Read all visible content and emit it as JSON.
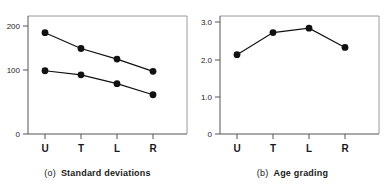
{
  "figure": {
    "panels": [
      {
        "caption_tag": "(o)",
        "caption_text": "Standard deviations",
        "x_ticks": [
          "U",
          "T",
          "L",
          "R"
        ],
        "y_ticks": [
          "0",
          "100",
          "200"
        ]
      },
      {
        "caption_tag": "(b)",
        "caption_text": "Age grading",
        "x_ticks": [
          "U",
          "T",
          "L",
          "R"
        ],
        "y_ticks": [
          "0",
          "1.0",
          "2.0",
          "3.0"
        ]
      }
    ]
  },
  "chart_data": [
    {
      "type": "line",
      "title": "Standard deviations",
      "panel_label": "(o)",
      "xlabel": "",
      "ylabel": "",
      "categories": [
        "U",
        "T",
        "L",
        "R"
      ],
      "ylim": [
        0,
        220
      ],
      "yticks": [
        0,
        100,
        200
      ],
      "grid": false,
      "legend": "none",
      "markers": "filled-circle",
      "series": [
        {
          "name": "upper",
          "values": [
            173,
            146,
            128,
            107
          ]
        },
        {
          "name": "lower",
          "values": [
            108,
            101,
            86,
            67
          ]
        }
      ]
    },
    {
      "type": "line",
      "title": "Age grading",
      "panel_label": "(b)",
      "xlabel": "",
      "ylabel": "",
      "categories": [
        "U",
        "T",
        "L",
        "R"
      ],
      "ylim": [
        0,
        3.2
      ],
      "yticks": [
        0,
        1.0,
        2.0,
        3.0
      ],
      "grid": false,
      "legend": "none",
      "markers": "filled-circle",
      "series": [
        {
          "name": "age grading",
          "values": [
            1.97,
            2.52,
            2.63,
            2.15
          ]
        }
      ]
    }
  ]
}
